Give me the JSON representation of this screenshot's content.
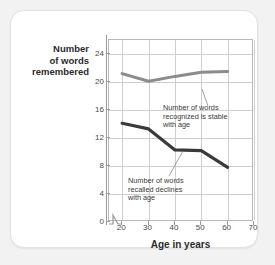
{
  "chart_data": {
    "type": "line",
    "title": "",
    "xlabel": "Age in years",
    "ylabel": "Number\nof words\nremembered",
    "xlim": [
      15,
      70
    ],
    "ylim": [
      0,
      26
    ],
    "xticks": [
      20,
      30,
      40,
      50,
      60,
      70
    ],
    "yticks": [
      0,
      4,
      8,
      12,
      16,
      20,
      24
    ],
    "grid": true,
    "legend": "none",
    "axis_break_x": true,
    "x": [
      20,
      30,
      40,
      50,
      60
    ],
    "series": [
      {
        "name": "Number of words recognized",
        "color": "#8c8c8c",
        "values": [
          21.2,
          20.1,
          20.8,
          21.4,
          21.5
        ]
      },
      {
        "name": "Number of words recalled",
        "color": "#3a3a3a",
        "values": [
          14.1,
          13.3,
          10.3,
          10.2,
          7.8
        ]
      }
    ],
    "annotations": [
      {
        "id": "recognized",
        "text": "Number of words\nrecognized is stable\nwith age",
        "points_to_x": 50,
        "points_to_y": 21.4
      },
      {
        "id": "recalled",
        "text": "Number of words\nrecalled declines\nwith age",
        "points_to_x": 46,
        "points_to_y": 10.2
      }
    ]
  },
  "axis": {
    "y_title": "Number\nof words\nremembered",
    "x_title": "Age in years",
    "y_tick_labels": [
      "0",
      "4",
      "8",
      "12",
      "16",
      "20",
      "24"
    ],
    "x_tick_labels": [
      "20",
      "30",
      "40",
      "50",
      "60",
      "70"
    ]
  },
  "annotations": {
    "recognized": "Number of words\nrecognized is stable\nwith age",
    "recalled": "Number of words\nrecalled declines\nwith age"
  },
  "colors": {
    "recognized_line": "#8c8c8c",
    "recalled_line": "#3a3a3a",
    "grid": "#cfcfcf",
    "axis": "#9a9a9a",
    "card_background": "#ffffff",
    "page_background": "#f2f2f2"
  }
}
